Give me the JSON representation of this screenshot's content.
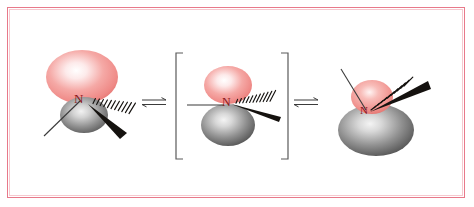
{
  "figure": {
    "kind": "chemistry-structure-diagram",
    "topic": "Nitrogen (amine) inversion equilibrium",
    "frame": {
      "border_color": "#e8798a",
      "inner_border_color": "#f6c9cf",
      "background": "#ffffff"
    }
  },
  "palette": {
    "lobe_pink_edge": "#f08b8b",
    "lobe_pink_core": "#fde9e9",
    "lobe_pink_rim": "#e0706f",
    "lobe_gray_edge": "#6f6f6f",
    "lobe_gray_core": "#e8e8e8",
    "lobe_gray_rim": "#4a4a4a",
    "bond_black": "#15120f",
    "bond_thin": "#3a3a3a",
    "atom_label_color": "#8a1720",
    "bracket_color": "#5a5a5a",
    "arrow_color": "#3b3b3b"
  },
  "structures": [
    {
      "id": "left-pyramidal",
      "name": "pyramidal-amine-left",
      "atom_label": "N",
      "description": "Pyramidal sp3 nitrogen: large pink lone-pair lobe above, small gray lobe below",
      "lobes": [
        {
          "name": "lone-pair-lobe",
          "color": "pink",
          "size": "large",
          "position": "above"
        },
        {
          "name": "back-lobe",
          "color": "gray",
          "size": "small",
          "position": "below"
        }
      ],
      "bonds": [
        {
          "name": "plain-bond",
          "style": "line",
          "direction": "down-left"
        },
        {
          "name": "hashed-wedge-bond",
          "style": "hashed-wedge",
          "direction": "right"
        },
        {
          "name": "solid-wedge-bond",
          "style": "solid-wedge",
          "direction": "down-right"
        }
      ]
    },
    {
      "id": "center-planar",
      "name": "planar-transition-state",
      "atom_label": "N",
      "bracketed": true,
      "description": "Planar sp2 transition state in square brackets: p-orbital with pink lobe above and gray lobe below",
      "lobes": [
        {
          "name": "p-orbital-top-lobe",
          "color": "pink",
          "size": "medium",
          "position": "above"
        },
        {
          "name": "p-orbital-bottom-lobe",
          "color": "gray",
          "size": "medium",
          "position": "below"
        }
      ],
      "bonds": [
        {
          "name": "plain-bond",
          "style": "line",
          "direction": "left"
        },
        {
          "name": "hashed-wedge-bond",
          "style": "hashed-wedge",
          "direction": "up-right"
        },
        {
          "name": "solid-wedge-bond",
          "style": "solid-wedge",
          "direction": "right"
        }
      ]
    },
    {
      "id": "right-pyramidal",
      "name": "pyramidal-amine-right-inverted",
      "atom_label": "N",
      "description": "Inverted pyramidal nitrogen: small pink lobe above, large gray lobe below, bonds pointing up",
      "lobes": [
        {
          "name": "lone-pair-lobe",
          "color": "pink",
          "size": "small",
          "position": "above"
        },
        {
          "name": "back-lobe",
          "color": "gray",
          "size": "large",
          "position": "below"
        }
      ],
      "bonds": [
        {
          "name": "plain-bond",
          "style": "line",
          "direction": "up-left"
        },
        {
          "name": "hashed-wedge-bond",
          "style": "hashed-wedge",
          "direction": "up-right"
        },
        {
          "name": "solid-wedge-bond",
          "style": "solid-wedge",
          "direction": "up-right-outer"
        }
      ]
    }
  ],
  "arrows": [
    {
      "id": "arrow-1",
      "name": "equilibrium-arrow-left",
      "glyph": "⇌",
      "type": "double-harpoon"
    },
    {
      "id": "arrow-2",
      "name": "equilibrium-arrow-right",
      "glyph": "⇌",
      "type": "double-harpoon"
    }
  ],
  "brackets": {
    "left": "[",
    "right": "]"
  }
}
